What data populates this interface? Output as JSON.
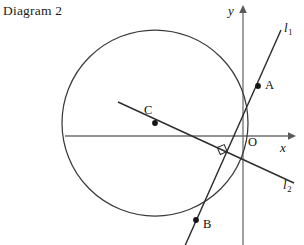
{
  "figure": {
    "caption": "Diagram 2",
    "background": "#ffffff",
    "stroke_color": "#333333",
    "axis_color": "#6b6b6b",
    "width": 304,
    "height": 245
  },
  "axes": {
    "x_label": "x",
    "y_label": "y",
    "origin_label": "O",
    "x_axis": {
      "y": 136,
      "x_start": 65,
      "x_end": 292
    },
    "y_axis": {
      "x": 243,
      "y_start": 10,
      "y_end": 245
    }
  },
  "circle": {
    "center_label": "C",
    "center_x": 155,
    "center_y": 123,
    "radius": 93
  },
  "points": [
    {
      "label": "A",
      "x": 258,
      "y": 86,
      "label_dx": 8,
      "label_dy": -5
    },
    {
      "label": "B",
      "x": 196,
      "y": 220,
      "label_dx": 7,
      "label_dy": -1
    },
    {
      "label": "C",
      "x": 155,
      "y": 123,
      "label_dx": -9,
      "label_dy": -17
    }
  ],
  "lines": [
    {
      "name": "l1",
      "label": "l",
      "subscript": "1",
      "label_x": 284,
      "label_y": 22,
      "x1": 279,
      "y1": 35,
      "x2": 186,
      "y2": 245
    },
    {
      "name": "l2",
      "label": "l",
      "subscript": "2",
      "label_x": 284,
      "label_y": 179,
      "x1": 120,
      "y1": 103,
      "x2": 292,
      "y2": 182
    }
  ],
  "right_angle_marker": {
    "name": "perpendicular-marker",
    "x": 222,
    "y": 153,
    "size": 7
  },
  "footer": {
    "clipped_text": " "
  }
}
